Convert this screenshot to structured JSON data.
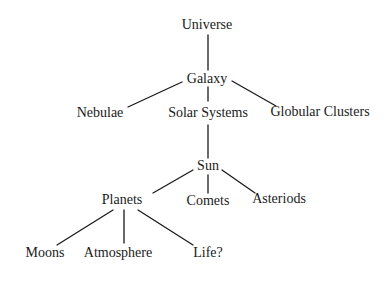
{
  "diagram": {
    "type": "tree",
    "root": "Universe",
    "nodes": [
      {
        "id": "universe",
        "label": "Universe",
        "x": 207,
        "y": 25
      },
      {
        "id": "galaxy",
        "label": "Galaxy",
        "x": 207,
        "y": 79
      },
      {
        "id": "nebulae",
        "label": "Nebulae",
        "x": 100,
        "y": 113
      },
      {
        "id": "solar_systems",
        "label": "Solar Systems",
        "x": 208,
        "y": 113
      },
      {
        "id": "globular_clusters",
        "label": "Globular Clusters",
        "x": 320,
        "y": 112
      },
      {
        "id": "sun",
        "label": "Sun",
        "x": 208,
        "y": 166
      },
      {
        "id": "planets",
        "label": "Planets",
        "x": 122,
        "y": 200
      },
      {
        "id": "comets",
        "label": "Comets",
        "x": 208,
        "y": 201
      },
      {
        "id": "asteriods",
        "label": "Asteriods",
        "x": 279,
        "y": 199
      },
      {
        "id": "moons",
        "label": "Moons",
        "x": 45,
        "y": 253
      },
      {
        "id": "atmosphere",
        "label": "Atmosphere",
        "x": 118,
        "y": 253
      },
      {
        "id": "life",
        "label": "Life?",
        "x": 208,
        "y": 253
      }
    ],
    "edges": [
      {
        "from": "universe",
        "to": "galaxy",
        "x1": 208,
        "y1": 35,
        "x2": 208,
        "y2": 70
      },
      {
        "from": "galaxy",
        "to": "nebulae",
        "x1": 182,
        "y1": 82,
        "x2": 128,
        "y2": 107
      },
      {
        "from": "galaxy",
        "to": "solar_systems",
        "x1": 208,
        "y1": 87,
        "x2": 208,
        "y2": 101
      },
      {
        "from": "galaxy",
        "to": "globular_clusters",
        "x1": 232,
        "y1": 81,
        "x2": 276,
        "y2": 106
      },
      {
        "from": "solar_systems",
        "to": "sun",
        "x1": 208,
        "y1": 125,
        "x2": 208,
        "y2": 158
      },
      {
        "from": "sun",
        "to": "planets",
        "x1": 193,
        "y1": 170,
        "x2": 153,
        "y2": 193
      },
      {
        "from": "sun",
        "to": "comets",
        "x1": 208,
        "y1": 175,
        "x2": 208,
        "y2": 193
      },
      {
        "from": "sun",
        "to": "asteriods",
        "x1": 222,
        "y1": 170,
        "x2": 255,
        "y2": 193
      },
      {
        "from": "planets",
        "to": "moons",
        "x1": 113,
        "y1": 210,
        "x2": 57,
        "y2": 245
      },
      {
        "from": "planets",
        "to": "atmosphere",
        "x1": 124,
        "y1": 210,
        "x2": 124,
        "y2": 243
      },
      {
        "from": "planets",
        "to": "life",
        "x1": 138,
        "y1": 210,
        "x2": 193,
        "y2": 245
      }
    ]
  },
  "labels": {
    "universe": "Universe",
    "galaxy": "Galaxy",
    "nebulae": "Nebulae",
    "solar_systems": "Solar Systems",
    "globular_clusters": "Globular Clusters",
    "sun": "Sun",
    "planets": "Planets",
    "comets": "Comets",
    "asteriods": "Asteriods",
    "moons": "Moons",
    "atmosphere": "Atmosphere",
    "life": "Life?"
  },
  "colors": {
    "background": "#ffffff",
    "ink": "#1a1a1a"
  }
}
